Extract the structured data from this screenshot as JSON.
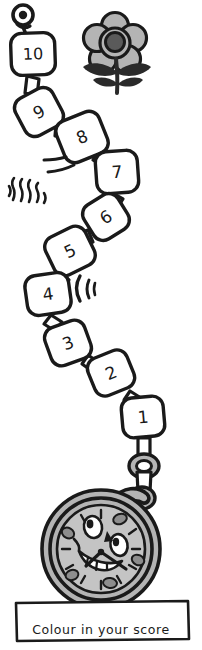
{
  "worksheet": {
    "title": "Colour in your score",
    "caption": "Colour in your score",
    "colors": {
      "ink": "#1a1a1a",
      "paper": "#ffffff",
      "flower_petal": "#b4b4b4",
      "flower_center": "#5a5a5a",
      "watch_case": "#b4b4b4",
      "watch_face": "#c4c4c4",
      "watch_marks": "#8d8d8d"
    }
  },
  "chain": {
    "name": "score-chain",
    "orientation": "top-to-bottom",
    "steps": [
      {
        "label": "10",
        "cx": 33,
        "cy": 54,
        "rot": -2,
        "w": 44,
        "h": 42
      },
      {
        "label": "9",
        "cx": 39,
        "cy": 112,
        "rot": -28,
        "w": 42,
        "h": 42
      },
      {
        "label": "8",
        "cx": 82,
        "cy": 137,
        "rot": -22,
        "w": 46,
        "h": 44
      },
      {
        "label": "7",
        "cx": 117,
        "cy": 172,
        "rot": -4,
        "w": 42,
        "h": 42
      },
      {
        "label": "6",
        "cx": 106,
        "cy": 217,
        "rot": -32,
        "w": 40,
        "h": 40
      },
      {
        "label": "5",
        "cx": 70,
        "cy": 251,
        "rot": -26,
        "w": 44,
        "h": 42
      },
      {
        "label": "4",
        "cx": 48,
        "cy": 294,
        "rot": -8,
        "w": 44,
        "h": 40
      },
      {
        "label": "3",
        "cx": 68,
        "cy": 343,
        "rot": -20,
        "w": 42,
        "h": 40
      },
      {
        "label": "2",
        "cx": 111,
        "cy": 373,
        "rot": -22,
        "w": 42,
        "h": 40
      },
      {
        "label": "1",
        "cx": 143,
        "cy": 417,
        "rot": -5,
        "w": 42,
        "h": 40
      }
    ]
  },
  "decorations": [
    {
      "name": "pin-knob",
      "kind": "ring-knob",
      "cx": 23,
      "cy": 15
    },
    {
      "name": "flower",
      "kind": "flower",
      "cx": 115,
      "cy": 45
    },
    {
      "name": "speed-lines",
      "kind": "speed-lines",
      "cx": 58,
      "cy": 162
    },
    {
      "name": "sparkle-lines",
      "kind": "squiggles",
      "cx": 22,
      "cy": 190
    },
    {
      "name": "swoosh-arc",
      "kind": "arc",
      "cx": 84,
      "cy": 288
    }
  ],
  "watch": {
    "name": "pocket-watch-mascot",
    "cx": 101,
    "cy": 545,
    "radius": 60,
    "face_expression": "smiling",
    "has_hands": true
  }
}
